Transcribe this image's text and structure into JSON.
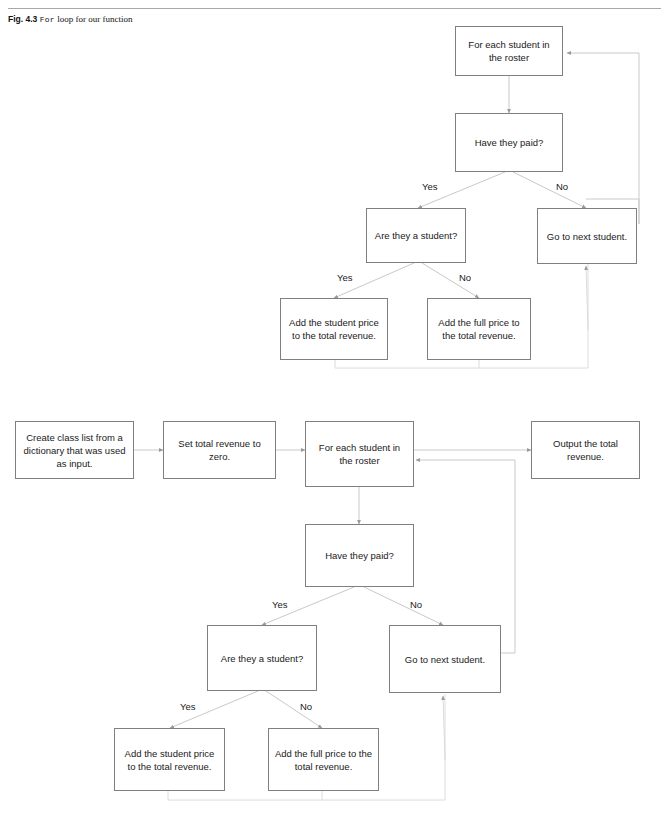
{
  "page": {
    "header_fragment": "",
    "caption": {
      "figure_number": "Fig. 4.3",
      "title_mono": "For",
      "title_serif": "loop for our function"
    }
  },
  "flowchart_top": {
    "name": "for-loop-detail",
    "nodes": [
      {
        "id": "for-each-student",
        "label": "For each student in the roster"
      },
      {
        "id": "have-they-paid",
        "label": "Have they paid?"
      },
      {
        "id": "are-they-a-student",
        "label": "Are they a student?"
      },
      {
        "id": "go-to-next-student",
        "label": "Go to next student."
      },
      {
        "id": "add-student-price",
        "label": "Add the student price to the total revenue."
      },
      {
        "id": "add-full-price",
        "label": "Add the full price to the total revenue."
      }
    ],
    "edge_labels": [
      {
        "id": "paid-yes",
        "label": "Yes"
      },
      {
        "id": "paid-no",
        "label": "No"
      },
      {
        "id": "student-yes",
        "label": "Yes"
      },
      {
        "id": "student-no",
        "label": "No"
      }
    ]
  },
  "flowchart_bottom": {
    "name": "full-function-flow",
    "nodes": [
      {
        "id": "create-class-list",
        "label": "Create class list from a dictionary that was used as input."
      },
      {
        "id": "set-total-revenue",
        "label": "Set total revenue to zero."
      },
      {
        "id": "for-each-student",
        "label": "For each student in the roster"
      },
      {
        "id": "output-total",
        "label": "Output the total revenue."
      },
      {
        "id": "have-they-paid",
        "label": "Have they paid?"
      },
      {
        "id": "are-they-a-student",
        "label": "Are they a student?"
      },
      {
        "id": "go-to-next-student",
        "label": "Go to next student."
      },
      {
        "id": "add-student-price",
        "label": "Add the student price to the total revenue."
      },
      {
        "id": "add-full-price",
        "label": "Add the full price to the total revenue."
      }
    ],
    "edge_labels": [
      {
        "id": "paid-yes",
        "label": "Yes"
      },
      {
        "id": "paid-no",
        "label": "No"
      },
      {
        "id": "student-yes",
        "label": "Yes"
      },
      {
        "id": "student-no",
        "label": "No"
      }
    ]
  },
  "style": {
    "box_border": "#7f7f7f",
    "connector": "#bfbfbf",
    "text": "#1a1a1a",
    "rule": "#a8a8a8"
  }
}
